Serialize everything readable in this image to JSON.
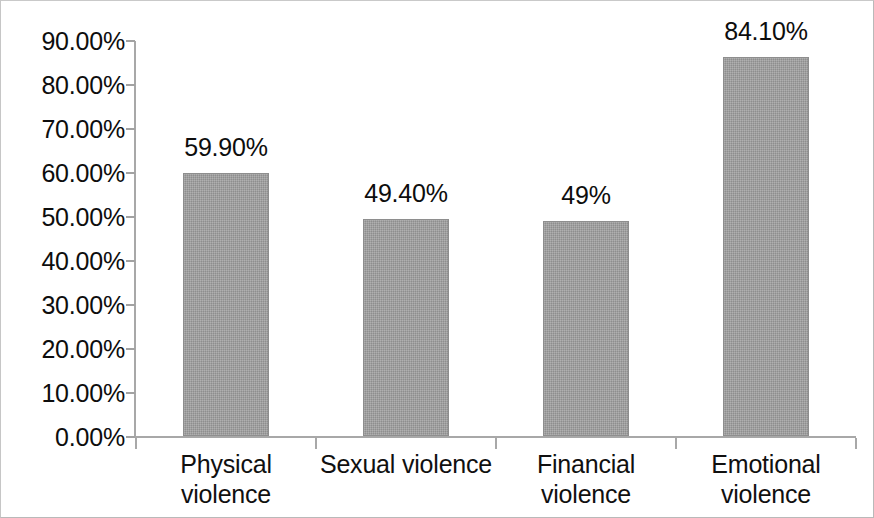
{
  "chart_data": {
    "type": "bar",
    "title": "",
    "subtitle": "",
    "xlabel": "",
    "ylabel": "",
    "categories": [
      "Physical violence",
      "Sexual violence",
      "Financial violence",
      "Emotional violence"
    ],
    "category_lines": [
      [
        "Physical",
        "violence"
      ],
      [
        "Sexual violence"
      ],
      [
        "Financial",
        "violence"
      ],
      [
        "Emotional",
        "violence"
      ]
    ],
    "values": [
      59.9,
      49.4,
      49.0,
      84.1
    ],
    "data_labels": [
      "59.90%",
      "49.40%",
      "49%",
      "84.10%"
    ],
    "ylim": [
      0,
      90
    ],
    "ytick_values": [
      0,
      10,
      20,
      30,
      40,
      50,
      60,
      70,
      80,
      90
    ],
    "ytick_labels": [
      "0.00%",
      "10.00%",
      "20.00%",
      "30.00%",
      "40.00%",
      "50.00%",
      "60.00%",
      "70.00%",
      "80.00%",
      "90.00%"
    ],
    "grid": false,
    "legend": null,
    "legend_position": "none",
    "bar_color": "#9c9c9c",
    "bar_border_color": "#8e8e8e",
    "axis_color": "#a8a8a8",
    "text_color": "#0d0d0d",
    "background_color": "#ffffff",
    "border_color": "#b9b9b9",
    "bar_plot_fraction": [
      0.665,
      0.549,
      0.544,
      0.956
    ]
  }
}
